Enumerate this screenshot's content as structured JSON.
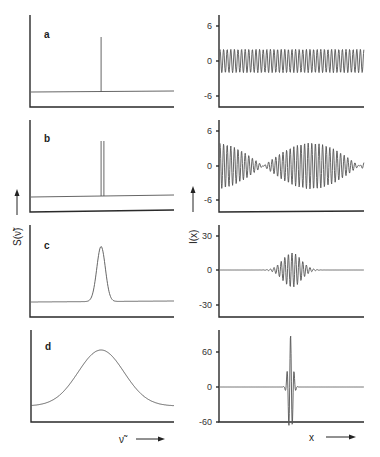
{
  "chart_data": [
    {
      "panel": "a",
      "side": "left",
      "type": "line",
      "description": "Monochromatic spectrum: single sharp line on flat baseline",
      "title": "",
      "label": "a",
      "xlabel": "ν̃",
      "ylabel": "S(ν̃)",
      "peaks": [
        {
          "position_frac": 0.49,
          "height_frac": 0.85
        }
      ]
    },
    {
      "panel": "a",
      "side": "right",
      "type": "line",
      "description": "Interferogram: constant-amplitude cosine",
      "xlabel": "x",
      "ylabel": "I(x)",
      "yticks": [
        6,
        0,
        -6
      ],
      "ylim": [
        -8.5,
        8.5
      ],
      "amplitude": 2,
      "cycles": 40
    },
    {
      "panel": "b",
      "side": "left",
      "type": "line",
      "description": "Two closely spaced lines (doublet)",
      "label": "b",
      "peaks": [
        {
          "position_frac": 0.49,
          "height_frac": 0.85
        },
        {
          "position_frac": 0.51,
          "height_frac": 0.85
        }
      ]
    },
    {
      "panel": "b",
      "side": "right",
      "type": "line",
      "description": "Interferogram: beat pattern of two cosines",
      "yticks": [
        6,
        0,
        -6
      ],
      "ylim": [
        -8.5,
        8.5
      ],
      "amplitude": 4,
      "cycles": 40,
      "beat_cycles": 1
    },
    {
      "panel": "c",
      "side": "left",
      "type": "line",
      "description": "Narrow Gaussian band",
      "label": "c",
      "peaks": [
        {
          "position_frac": 0.49,
          "height_frac": 0.85,
          "width_frac": 0.03
        }
      ]
    },
    {
      "panel": "c",
      "side": "right",
      "type": "line",
      "description": "Interferogram: Gaussian-damped wave packet",
      "yticks": [
        30,
        0,
        -30
      ],
      "ylim": [
        -40,
        40
      ],
      "amplitude": 15,
      "cycles": 40
    },
    {
      "panel": "d",
      "side": "left",
      "type": "line",
      "description": "Broad Gaussian band",
      "label": "d",
      "peaks": [
        {
          "position_frac": 0.49,
          "height_frac": 0.75,
          "width_frac": 0.16
        }
      ]
    },
    {
      "panel": "d",
      "side": "right",
      "type": "line",
      "description": "Interferogram: sharp centerburst",
      "yticks": [
        60,
        0,
        -60
      ],
      "ylim": [
        -60,
        100
      ],
      "amplitude": 90,
      "cycles": 40
    }
  ],
  "labels": {
    "panel_a": "a",
    "panel_b": "b",
    "panel_c": "c",
    "panel_d": "d",
    "left_ylabel": "S(ν̃)",
    "right_ylabel": "I(x)",
    "left_xlabel": "ν̃",
    "right_xlabel": "x"
  },
  "ticks": {
    "a": [
      "6",
      "0",
      "-6"
    ],
    "b": [
      "6",
      "0",
      "-6"
    ],
    "c": [
      "30",
      "0",
      "-30"
    ],
    "d": [
      "60",
      "0",
      "-60"
    ]
  }
}
